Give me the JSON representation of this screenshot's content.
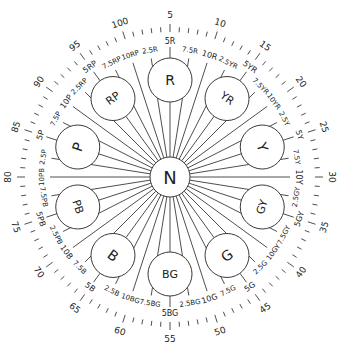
{
  "diagram": {
    "center_label": "N",
    "center": {
      "x": 170,
      "y": 177
    },
    "colors": {
      "line": "#3a3a3a",
      "text": "#222222",
      "background": "#ffffff"
    },
    "principal_hues": [
      {
        "label": "R",
        "number": 5
      },
      {
        "label": "YR",
        "number": 15
      },
      {
        "label": "Y",
        "number": 25
      },
      {
        "label": "GY",
        "number": 35
      },
      {
        "label": "G",
        "number": 45
      },
      {
        "label": "BG",
        "number": 55
      },
      {
        "label": "B",
        "number": 65
      },
      {
        "label": "PB",
        "number": 75
      },
      {
        "label": "P",
        "number": 85
      },
      {
        "label": "RP",
        "number": 95
      }
    ],
    "hue_labels": [
      "2.5R",
      "5R",
      "7.5R",
      "10R",
      "2.5YR",
      "5YR",
      "7.5YR",
      "10YR",
      "2.5Y",
      "5Y",
      "7.5Y",
      "10Y",
      "2.5GY",
      "5GY",
      "7.5GY",
      "10GY",
      "2.5G",
      "5G",
      "7.5G",
      "10G",
      "2.5BG",
      "5BG",
      "7.5BG",
      "10BG",
      "2.5B",
      "5B",
      "7.5B",
      "10B",
      "2.5PB",
      "5PB",
      "7.5PB",
      "10PB",
      "2.5P",
      "5P",
      "7.5P",
      "10P",
      "2.5RP",
      "5RP",
      "7.5RP",
      "10RP"
    ],
    "outer_numbers": [
      "5",
      "10",
      "15",
      "20",
      "25",
      "30",
      "35",
      "40",
      "45",
      "50",
      "55",
      "60",
      "65",
      "70",
      "75",
      "80",
      "85",
      "90",
      "95",
      "100"
    ],
    "tick_count": 100
  }
}
